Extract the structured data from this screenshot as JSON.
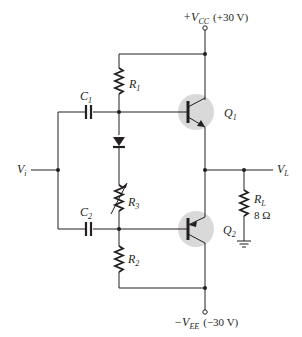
{
  "diagram": {
    "supply_positive": {
      "symbol": "+V",
      "subscript": "CC",
      "value": "(+30 V)"
    },
    "supply_negative": {
      "symbol": "−V",
      "subscript": "EE",
      "value": "(−30 V)"
    },
    "input": {
      "symbol": "V",
      "subscript": "i"
    },
    "output": {
      "symbol": "V",
      "subscript": "L"
    },
    "components": {
      "C1": {
        "symbol": "C",
        "subscript": "1"
      },
      "C2": {
        "symbol": "C",
        "subscript": "2"
      },
      "R1": {
        "symbol": "R",
        "subscript": "1"
      },
      "R2": {
        "symbol": "R",
        "subscript": "2"
      },
      "R3": {
        "symbol": "R",
        "subscript": "3"
      },
      "RL": {
        "symbol": "R",
        "subscript": "L",
        "value": "8 Ω"
      },
      "Q1": {
        "symbol": "Q",
        "subscript": "1"
      },
      "Q2": {
        "symbol": "Q",
        "subscript": "2"
      }
    },
    "colors": {
      "ink": "#231f20",
      "transistor_shade": "#d9d9d9",
      "background": "#ffffff"
    }
  }
}
